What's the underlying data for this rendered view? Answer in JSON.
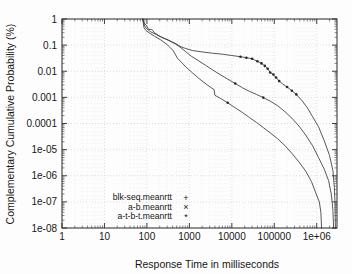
{
  "chart_data": {
    "type": "line",
    "title": "",
    "subtitle": "",
    "xlabel": "Response Time in milliseconds",
    "ylabel": "Complementary Cumulative Probability (%)",
    "xscale": "log",
    "yscale": "log",
    "xlim": [
      1,
      3000000
    ],
    "ylim": [
      1e-08,
      1
    ],
    "grid": true,
    "legend_position": "bottom-left",
    "xticks": [
      1,
      10,
      100,
      1000,
      10000,
      100000,
      1000000
    ],
    "xtick_labels": [
      "1",
      "10",
      "100",
      "1000",
      "10000",
      "100000",
      "1e+06"
    ],
    "yticks": [
      1,
      0.1,
      0.01,
      0.001,
      0.0001,
      1e-05,
      1e-06,
      1e-07,
      1e-08
    ],
    "ytick_labels": [
      "1",
      "0.1",
      "0.01",
      "0.001",
      "0.0001",
      "1e-05",
      "1e-06",
      "1e-07",
      "1e-08"
    ],
    "series": [
      {
        "name": "blk-seq.meanrtt",
        "marker": "+",
        "marker_glyph": "+",
        "color": "#3a3a3a",
        "points": [
          [
            80,
            1.0
          ],
          [
            90,
            0.62
          ],
          [
            95,
            0.6
          ],
          [
            110,
            0.4
          ],
          [
            130,
            0.4
          ],
          [
            150,
            0.3
          ],
          [
            200,
            0.22
          ],
          [
            280,
            0.17
          ],
          [
            400,
            0.13
          ],
          [
            500,
            0.11
          ],
          [
            600,
            0.09
          ],
          [
            800,
            0.075
          ],
          [
            1200,
            0.062
          ],
          [
            2000,
            0.055
          ],
          [
            3500,
            0.049
          ],
          [
            6000,
            0.045
          ],
          [
            10000,
            0.04
          ],
          [
            16000,
            0.036
          ],
          [
            22000,
            0.033
          ],
          [
            30000,
            0.03
          ],
          [
            40000,
            0.024
          ],
          [
            50000,
            0.02
          ],
          [
            60000,
            0.016
          ],
          [
            70000,
            0.0125
          ],
          [
            80000,
            0.009
          ],
          [
            95000,
            0.0075
          ],
          [
            110000,
            0.0058
          ],
          [
            130000,
            0.0042
          ],
          [
            160000,
            0.0032
          ],
          [
            200000,
            0.0025
          ],
          [
            260000,
            0.0018
          ],
          [
            330000,
            0.0013
          ],
          [
            450000,
            0.00075
          ],
          [
            600000,
            0.0004
          ],
          [
            800000,
            0.00018
          ],
          [
            1100000,
            7.5e-05
          ],
          [
            1500000,
            2.2e-05
          ],
          [
            2000000,
            6e-06
          ],
          [
            2400000,
            1.6e-06
          ],
          [
            2600000,
            3.5e-07
          ],
          [
            2700000,
            8e-08
          ],
          [
            2750000,
            1e-08
          ]
        ]
      },
      {
        "name": "a-b.meanrtt",
        "marker": "x",
        "marker_glyph": "×",
        "color": "#3a3a3a",
        "points": [
          [
            80,
            1.0
          ],
          [
            88,
            0.55
          ],
          [
            100,
            0.42
          ],
          [
            120,
            0.33
          ],
          [
            160,
            0.26
          ],
          [
            220,
            0.2
          ],
          [
            320,
            0.155
          ],
          [
            450,
            0.115
          ],
          [
            600,
            0.085
          ],
          [
            800,
            0.058
          ],
          [
            1100,
            0.038
          ],
          [
            1600,
            0.026
          ],
          [
            2400,
            0.017
          ],
          [
            3600,
            0.011
          ],
          [
            5500,
            0.0072
          ],
          [
            8000,
            0.005
          ],
          [
            12000,
            0.0034
          ],
          [
            18000,
            0.0023
          ],
          [
            26000,
            0.0017
          ],
          [
            38000,
            0.0013
          ],
          [
            55000,
            0.00098
          ],
          [
            80000,
            0.00072
          ],
          [
            120000,
            0.00048
          ],
          [
            180000,
            0.00028
          ],
          [
            260000,
            0.00016
          ],
          [
            380000,
            8e-05
          ],
          [
            550000,
            3.6e-05
          ],
          [
            800000,
            1.4e-05
          ],
          [
            1100000,
            5e-06
          ],
          [
            1500000,
            1.8e-06
          ],
          [
            1900000,
            6.5e-07
          ],
          [
            2200000,
            2e-07
          ],
          [
            2400000,
            5e-08
          ],
          [
            2500000,
            1e-08
          ]
        ]
      },
      {
        "name": "a-t-b-t.meanrtt",
        "marker": "*",
        "marker_glyph": "*",
        "color": "#3a3a3a",
        "points": [
          [
            80,
            1.0
          ],
          [
            85,
            0.48
          ],
          [
            95,
            0.36
          ],
          [
            115,
            0.29
          ],
          [
            150,
            0.22
          ],
          [
            210,
            0.16
          ],
          [
            300,
            0.105
          ],
          [
            420,
            0.06
          ],
          [
            520,
            0.032
          ],
          [
            650,
            0.022
          ],
          [
            850,
            0.014
          ],
          [
            1200,
            0.0085
          ],
          [
            1700,
            0.0052
          ],
          [
            2500,
            0.0032
          ],
          [
            3600,
            0.0021
          ],
          [
            3800,
            0.002
          ],
          [
            4000,
            0.0012
          ],
          [
            5500,
            0.0009
          ],
          [
            8000,
            0.00062
          ],
          [
            12000,
            0.0004
          ],
          [
            18000,
            0.00026
          ],
          [
            26000,
            0.00017
          ],
          [
            38000,
            0.00011
          ],
          [
            55000,
            7e-05
          ],
          [
            80000,
            4.4e-05
          ],
          [
            120000,
            2.6e-05
          ],
          [
            180000,
            1.4e-05
          ],
          [
            260000,
            7.2e-06
          ],
          [
            380000,
            3.4e-06
          ],
          [
            550000,
            1.5e-06
          ],
          [
            750000,
            6e-07
          ],
          [
            950000,
            2.2e-07
          ],
          [
            1150000,
            1e-07
          ],
          [
            1250000,
            4e-08
          ],
          [
            1300000,
            1e-08
          ]
        ]
      }
    ],
    "marker_points": [
      {
        "series": "a-t-b-t.meanrtt",
        "x": 16000,
        "y": 0.036
      },
      {
        "series": "a-t-b-t.meanrtt",
        "x": 22000,
        "y": 0.033
      },
      {
        "series": "a-t-b-t.meanrtt",
        "x": 30000,
        "y": 0.03
      },
      {
        "series": "a-t-b-t.meanrtt",
        "x": 40000,
        "y": 0.024
      },
      {
        "series": "a-t-b-t.meanrtt",
        "x": 50000,
        "y": 0.02
      },
      {
        "series": "a-t-b-t.meanrtt",
        "x": 60000,
        "y": 0.016
      },
      {
        "series": "a-t-b-t.meanrtt",
        "x": 70000,
        "y": 0.0125
      },
      {
        "series": "a-t-b-t.meanrtt",
        "x": 80000,
        "y": 0.009
      },
      {
        "series": "a-t-b-t.meanrtt",
        "x": 95000,
        "y": 0.0075
      },
      {
        "series": "a-t-b-t.meanrtt",
        "x": 110000,
        "y": 0.0058
      },
      {
        "series": "a-t-b-t.meanrtt",
        "x": 130000,
        "y": 0.0042
      },
      {
        "series": "a-t-b-t.meanrtt",
        "x": 200000,
        "y": 0.0025
      },
      {
        "series": "a-t-b-t.meanrtt",
        "x": 260000,
        "y": 0.0018
      },
      {
        "series": "a-t-b-t.meanrtt",
        "x": 330000,
        "y": 0.0013
      },
      {
        "series": "a-b.meanrtt",
        "x": 12000,
        "y": 0.0034
      },
      {
        "series": "a-b.meanrtt",
        "x": 55000,
        "y": 0.00098
      },
      {
        "series": "a-b.meanrtt",
        "x": 8000,
        "y": 0.00062
      }
    ]
  },
  "legend": {
    "entries": [
      {
        "label": "blk-seq.meanrtt",
        "marker": "+"
      },
      {
        "label": "a-b.meanrtt",
        "marker": "×"
      },
      {
        "label": "a-t-b-t.meanrtt",
        "marker": "*"
      }
    ]
  },
  "colors": {
    "background": "#fdfdfd",
    "frame": "#2b2b2b",
    "grid": "#c9c9c9",
    "curve": "#3a3a3a",
    "text": "#161616"
  }
}
